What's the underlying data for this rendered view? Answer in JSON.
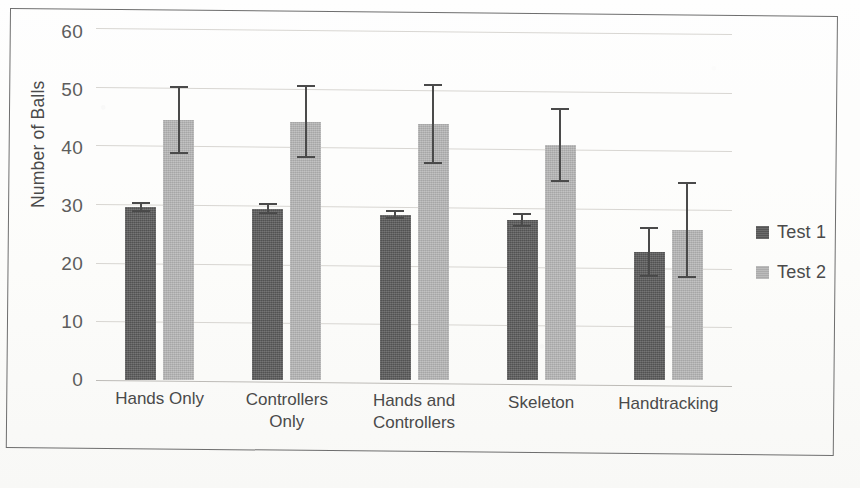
{
  "chart_data": {
    "type": "bar",
    "title": "",
    "subtitle": "",
    "xlabel": "",
    "ylabel": "Number of Balls",
    "ylim": [
      0,
      60
    ],
    "yticks": [
      0,
      10,
      20,
      30,
      40,
      50,
      60
    ],
    "ytick_labels": [
      "0",
      "10",
      "20",
      "30",
      "40",
      "50",
      "60"
    ],
    "grid": true,
    "grid_axis": "y",
    "legend_position": "right",
    "error_bars": true,
    "categories": [
      "Hands Only",
      "Controllers Only",
      "Hands and Controllers",
      "Skeleton",
      "Handtracking"
    ],
    "category_label_lines": [
      [
        "Hands Only"
      ],
      [
        "Controllers",
        "Only"
      ],
      [
        "Hands and",
        "Controllers"
      ],
      [
        "Skeleton"
      ],
      [
        "Handtracking"
      ]
    ],
    "series": [
      {
        "name": "Test 1",
        "color": "#595959",
        "values": [
          29.5,
          29.2,
          28.2,
          27.2,
          21.8
        ],
        "errors": [
          0.8,
          0.9,
          0.8,
          1.2,
          4.3
        ]
      },
      {
        "name": "Test 2",
        "color": "#b6b6b6",
        "values": [
          44.3,
          44.0,
          43.7,
          40.0,
          25.6
        ],
        "errors": [
          5.8,
          6.2,
          6.8,
          6.3,
          8.2
        ]
      }
    ]
  },
  "legend": {
    "items": [
      {
        "label": "Test 1",
        "swatch_class": "s1"
      },
      {
        "label": "Test 2",
        "swatch_class": "s2"
      }
    ]
  },
  "caption": {
    "text": ""
  }
}
